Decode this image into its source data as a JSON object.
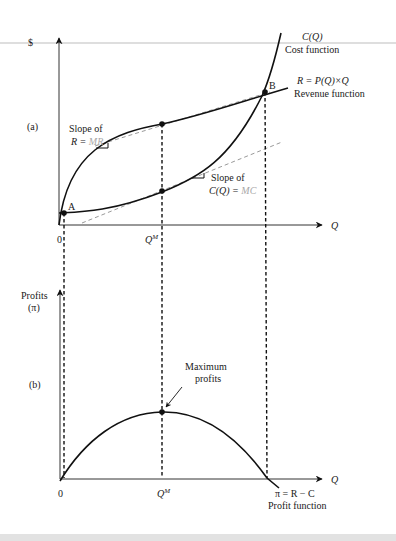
{
  "figure": {
    "panel_a": {
      "tag": "(a)",
      "y_axis_label": "$",
      "x_axis_label": "Q",
      "origin_label": "0",
      "qm_label": "Q",
      "qm_superscript": "M",
      "cost_curve": {
        "name": "C(Q)",
        "description": "Cost function"
      },
      "revenue_curve": {
        "name": "R = P(Q)×Q",
        "description": "Revenue function"
      },
      "point_a": "A",
      "point_b": "B",
      "mr_annotation": {
        "line1": "Slope of",
        "prefix": "R = ",
        "highlight": "MR"
      },
      "mc_annotation": {
        "line1": "Slope of",
        "prefix": "C(Q) = ",
        "highlight": "MC"
      }
    },
    "panel_b": {
      "tag": "(b)",
      "y_axis_label_1": "Profits",
      "y_axis_label_2": "(π)",
      "x_axis_label": "Q",
      "origin_label": "0",
      "qm_label": "Q",
      "qm_superscript": "M",
      "max_annotation_1": "Maximum",
      "max_annotation_2": "profits",
      "profit_curve": {
        "name": "π = R − C",
        "description": "Profit function"
      }
    },
    "colors": {
      "curve": "#111111",
      "tangent": "#9a9a9a",
      "highlight_text": "#a8a8a8",
      "top_rule": "#bdbdbd"
    }
  }
}
